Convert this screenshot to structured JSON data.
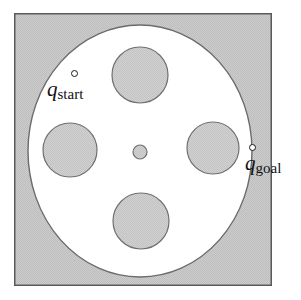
{
  "figure": {
    "colors": {
      "obstacle_fill": "#c9c9c9",
      "free_space_fill": "#ffffff",
      "outline": "#4a4a4a",
      "frame_border": "#555555",
      "label_text": "#111111"
    },
    "frame": {
      "x": 14,
      "y": 13,
      "width": 258,
      "height": 273,
      "border_width": 1.5
    },
    "free_space_ellipse": {
      "cx": 140,
      "cy": 151,
      "rx": 112,
      "ry": 126
    },
    "obstacles": [
      {
        "name": "obstacle-top",
        "cx": 140,
        "cy": 75,
        "r": 28
      },
      {
        "name": "obstacle-left",
        "cx": 70,
        "cy": 150,
        "r": 27
      },
      {
        "name": "obstacle-right",
        "cx": 213,
        "cy": 148,
        "r": 26
      },
      {
        "name": "obstacle-bottom",
        "cx": 141,
        "cy": 221,
        "r": 28
      },
      {
        "name": "obstacle-center",
        "cx": 140,
        "cy": 152,
        "r": 7
      }
    ],
    "points": [
      {
        "name": "start",
        "symbol": "q",
        "subscript": "start",
        "marker_cx": 75,
        "marker_cy": 74,
        "marker_r": 3.5
      },
      {
        "name": "goal",
        "symbol": "q",
        "subscript": "goal",
        "marker_cx": 253,
        "marker_cy": 148,
        "marker_r": 3.5
      }
    ]
  }
}
